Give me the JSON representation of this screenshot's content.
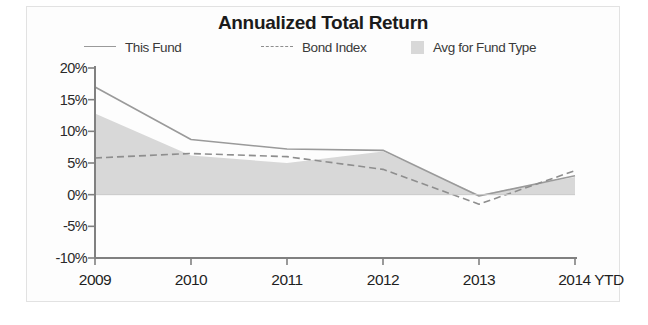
{
  "chart_data": {
    "type": "area",
    "title": "Annualized Total Return",
    "xlabel": "",
    "ylabel": "",
    "categories": [
      "2009",
      "2010",
      "2011",
      "2012",
      "2013",
      "2014 YTD"
    ],
    "ylim": [
      -10,
      20
    ],
    "ytick_labels": [
      "20%",
      "15%",
      "10%",
      "5%",
      "0%",
      "-5%",
      "-10%"
    ],
    "ytick_values": [
      20,
      15,
      10,
      5,
      0,
      -5,
      -10
    ],
    "grid": false,
    "legend_position": "top",
    "series": [
      {
        "name": "This Fund",
        "style": "solid-line",
        "color": "#9a9a9a",
        "values": [
          17.0,
          8.7,
          7.2,
          7.0,
          -0.2,
          3.0
        ]
      },
      {
        "name": "Bond Index",
        "style": "dashed-line",
        "color": "#8e8e8e",
        "values": [
          5.8,
          6.5,
          6.0,
          4.0,
          -1.5,
          3.8
        ]
      },
      {
        "name": "Avg for Fund Type",
        "style": "filled-area",
        "color": "#d8d8d8",
        "values": [
          12.8,
          6.2,
          5.0,
          6.8,
          0.0,
          2.8
        ]
      }
    ]
  },
  "legend": {
    "items": [
      {
        "label": "This Fund",
        "marker": "solid-line-key"
      },
      {
        "label": "Bond Index",
        "marker": "dashed-line-key"
      },
      {
        "label": "Avg for Fund Type",
        "marker": "gray-swatch-key"
      }
    ]
  },
  "colors": {
    "area_fill": "#d8d8d8",
    "this_fund_line": "#9a9a9a",
    "bond_index_line": "#8e8e8e",
    "axis": "#808080",
    "title_text": "#1b1b1b",
    "tick_text": "#1f1f1f",
    "background": "#fdfdfd"
  }
}
